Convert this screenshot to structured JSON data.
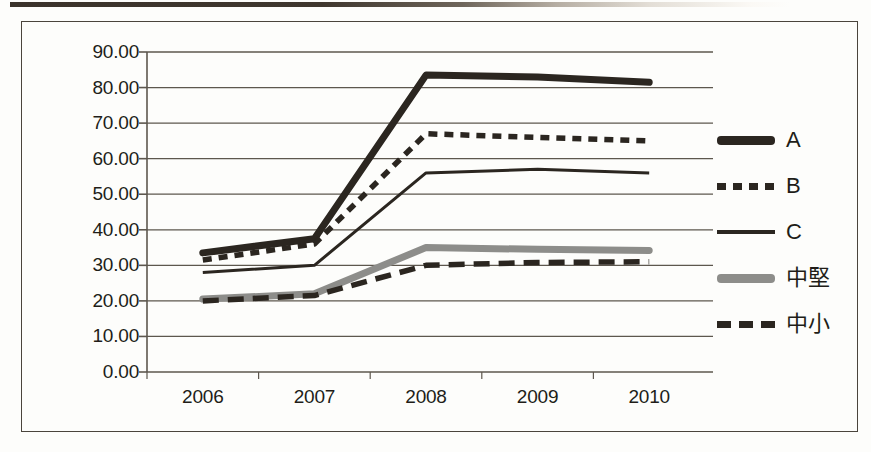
{
  "chart_data": {
    "type": "line",
    "title": "",
    "xlabel": "",
    "ylabel": "",
    "categories": [
      "2006",
      "2007",
      "2008",
      "2009",
      "2010"
    ],
    "ytick_labels": [
      "90.00",
      "80.00",
      "70.00",
      "60.00",
      "50.00",
      "40.00",
      "30.00",
      "20.00",
      "10.00",
      "0.00"
    ],
    "ytick_values": [
      90,
      80,
      70,
      60,
      50,
      40,
      30,
      20,
      10,
      0
    ],
    "ylim": [
      0,
      90
    ],
    "grid": true,
    "legend_position": "right",
    "series": [
      {
        "name": "A",
        "style": "thick-solid",
        "color": "#2b2620",
        "values": [
          33.5,
          37.5,
          83.5,
          83.0,
          81.5
        ]
      },
      {
        "name": "B",
        "style": "dotted",
        "color": "#2b2620",
        "values": [
          31.5,
          36.0,
          67.0,
          66.0,
          65.0
        ]
      },
      {
        "name": "C",
        "style": "thin-solid",
        "color": "#2b2620",
        "values": [
          28.0,
          30.0,
          56.0,
          57.0,
          56.0
        ]
      },
      {
        "name": "中堅",
        "style": "thick-gray-solid",
        "color": "#8d8d8a",
        "values": [
          20.5,
          22.0,
          35.0,
          34.5,
          34.2
        ]
      },
      {
        "name": "中小",
        "style": "dashed",
        "color": "#2b2620",
        "values": [
          20.0,
          21.5,
          30.0,
          30.8,
          31.0
        ]
      }
    ]
  },
  "colors": {
    "dark": "#2b2620",
    "gray": "#8d8d8a",
    "gridline": "#5d574e",
    "frame": "#4a443c",
    "background": "#fdfdfb"
  }
}
